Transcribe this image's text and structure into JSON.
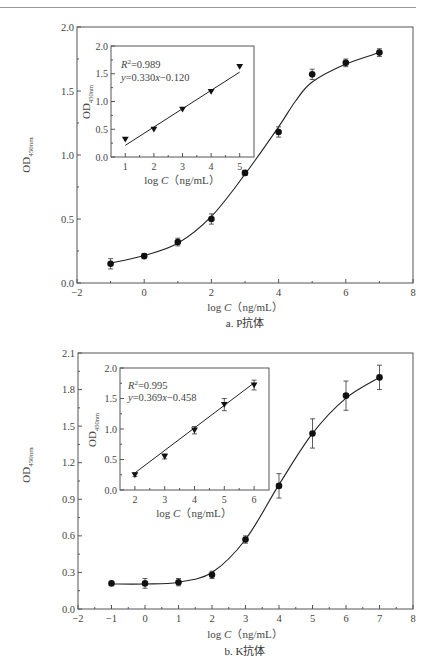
{
  "chart_data": [
    {
      "id": "a",
      "type": "line",
      "caption": "a. P抗体",
      "xlabel": "log C（ng/mL）",
      "ylabel": "OD450nm",
      "xlim": [
        -2,
        8
      ],
      "ylim": [
        0.0,
        2.0
      ],
      "xticks": [
        -2,
        0,
        2,
        4,
        6,
        8
      ],
      "yticks": [
        0.0,
        0.5,
        1.0,
        1.5,
        2.0
      ],
      "ytick_labels": [
        "0.0",
        "0.5",
        "1.0",
        "1.5",
        "2.0"
      ],
      "grid": false,
      "series": [
        {
          "name": "P antibody",
          "marker": "circle",
          "x": [
            -1,
            0,
            1,
            2,
            3,
            4,
            5,
            6,
            7
          ],
          "y": [
            0.15,
            0.21,
            0.32,
            0.5,
            0.86,
            1.18,
            1.63,
            1.72,
            1.8
          ],
          "err": [
            0.04,
            0.02,
            0.03,
            0.04,
            0.02,
            0.04,
            0.04,
            0.03,
            0.03
          ],
          "fit": "sigmoid"
        }
      ],
      "inset": {
        "type": "scatter",
        "xlabel": "log C（ng/mL）",
        "ylabel": "OD450nm",
        "xlim": [
          0.5,
          5.5
        ],
        "ylim": [
          0.0,
          2.0
        ],
        "xticks": [
          1,
          2,
          3,
          4,
          5
        ],
        "yticks": [
          0.0,
          0.5,
          1.0,
          1.5,
          2.0
        ],
        "ytick_labels": [
          "0.0",
          "0.5",
          "1.0",
          "1.5",
          "2.0"
        ],
        "marker": "triangle-down",
        "x": [
          1,
          2,
          3,
          4,
          5
        ],
        "y": [
          0.32,
          0.5,
          0.86,
          1.18,
          1.63
        ],
        "annotation_r2": "R²=0.989",
        "annotation_eq": "y=0.330x−0.120",
        "fit_line": {
          "slope": 0.33,
          "intercept": -0.12
        }
      }
    },
    {
      "id": "b",
      "type": "line",
      "caption": "b. K抗体",
      "xlabel": "log C（ng/mL）",
      "ylabel": "OD450nm",
      "xlim": [
        -2,
        8
      ],
      "ylim": [
        0.0,
        2.1
      ],
      "xticks": [
        -2,
        -1,
        0,
        1,
        2,
        3,
        4,
        5,
        6,
        7,
        8
      ],
      "yticks": [
        0.0,
        0.3,
        0.6,
        0.9,
        1.2,
        1.5,
        1.8,
        2.1
      ],
      "ytick_labels": [
        "0.0",
        "0.3",
        "0.6",
        "0.9",
        "1.2",
        "1.5",
        "1.8",
        "2.1"
      ],
      "grid": false,
      "series": [
        {
          "name": "K antibody",
          "marker": "circle",
          "x": [
            -1,
            0,
            1,
            2,
            3,
            4,
            5,
            6,
            7
          ],
          "y": [
            0.21,
            0.21,
            0.22,
            0.28,
            0.57,
            1.01,
            1.44,
            1.75,
            1.9
          ],
          "err": [
            0.01,
            0.04,
            0.03,
            0.03,
            0.03,
            0.1,
            0.12,
            0.12,
            0.1
          ],
          "fit": "sigmoid"
        }
      ],
      "inset": {
        "type": "scatter",
        "xlabel": "log C（ng/mL）",
        "ylabel": "OD450nm",
        "xlim": [
          1.5,
          6.5
        ],
        "ylim": [
          0.0,
          2.0
        ],
        "xticks": [
          2,
          3,
          4,
          5,
          6
        ],
        "yticks": [
          0.0,
          0.5,
          1.0,
          1.5,
          2.0
        ],
        "ytick_labels": [
          "0.0",
          "0.5",
          "1.0",
          "1.5",
          "2.0"
        ],
        "marker": "triangle-down",
        "x": [
          2,
          3,
          4,
          5,
          6
        ],
        "y": [
          0.25,
          0.55,
          0.98,
          1.4,
          1.72
        ],
        "err": [
          0.03,
          0.04,
          0.06,
          0.1,
          0.08
        ],
        "annotation_r2": "R²=0.995",
        "annotation_eq": "y=0.369x−0.458",
        "fit_line": {
          "slope": 0.369,
          "intercept": -0.458
        }
      }
    }
  ],
  "labels": {
    "a": {
      "caption": "a. P抗体",
      "xlabel_prefix": "log ",
      "xlabel_var": "C",
      "xlabel_unit": "（ng/mL）",
      "ylabel_main": "OD",
      "ylabel_sub": "450nm",
      "inset_r2_var": "R",
      "inset_r2_sup": "2",
      "inset_r2_val": "=0.989",
      "inset_eq_y": "y",
      "inset_eq_mid": "=0.330",
      "inset_eq_x": "x",
      "inset_eq_tail": "−0.120"
    },
    "b": {
      "caption": "b. K抗体",
      "xlabel_prefix": "log ",
      "xlabel_var": "C",
      "xlabel_unit": "（ng/mL）",
      "ylabel_main": "OD",
      "ylabel_sub": "450nm",
      "inset_r2_var": "R",
      "inset_r2_sup": "2",
      "inset_r2_val": "=0.995",
      "inset_eq_y": "y",
      "inset_eq_mid": "=0.369",
      "inset_eq_x": "x",
      "inset_eq_tail": "−0.458"
    }
  }
}
